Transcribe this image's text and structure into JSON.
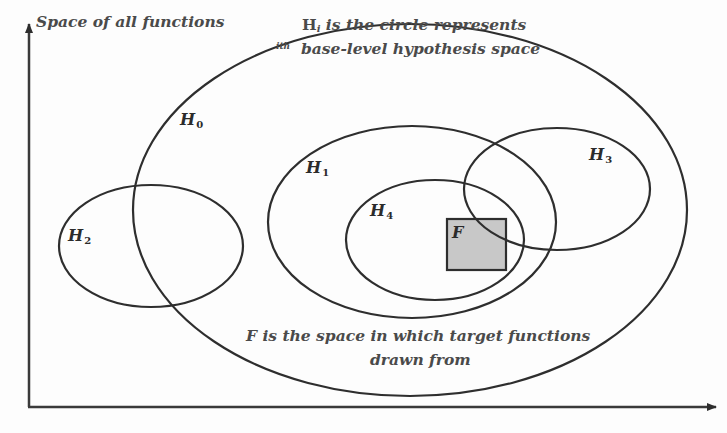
{
  "diagram": {
    "axis_y_label": "Space of all functions",
    "legend_top": {
      "line1_prefix": "H",
      "line1_sub": "i",
      "line1_rest": " is the circle represents",
      "line2_sup": "ith",
      "line2_rest": "  base-level hypothesis space"
    },
    "legend_bottom": {
      "line1": "F is the space in which target functions",
      "line2": "drawn from"
    },
    "hypothesis_spaces": [
      {
        "id": "H0",
        "letter": "H",
        "index": "0"
      },
      {
        "id": "H1",
        "letter": "H",
        "index": "1"
      },
      {
        "id": "H2",
        "letter": "H",
        "index": "2"
      },
      {
        "id": "H3",
        "letter": "H",
        "index": "3"
      },
      {
        "id": "H4",
        "letter": "H",
        "index": "4"
      }
    ],
    "target_region": {
      "label": "F",
      "fill": "#c8c8c8"
    },
    "colors": {
      "stroke": "#2e2e2e",
      "background": "#fdfdfd",
      "text": "#3a3a3a"
    }
  }
}
